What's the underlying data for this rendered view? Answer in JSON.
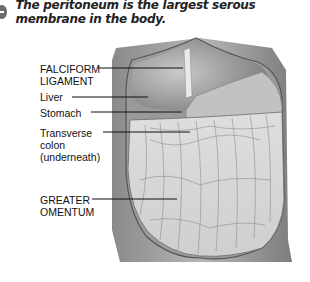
{
  "caption": {
    "icon": "circle-minus-icon",
    "text": "The peritoneum is the largest serous membrane in the body."
  },
  "figure": {
    "labels": [
      {
        "id": "falciform",
        "line1": "FALCIFORM",
        "line2": "LIGAMENT"
      },
      {
        "id": "liver",
        "line1": "Liver"
      },
      {
        "id": "stomach",
        "line1": "Stomach"
      },
      {
        "id": "transverse",
        "line1": "Transverse",
        "line2": "colon",
        "line3": "(underneath)"
      },
      {
        "id": "omentum",
        "line1": "GREATER",
        "line2": "OMENTUM"
      }
    ]
  }
}
